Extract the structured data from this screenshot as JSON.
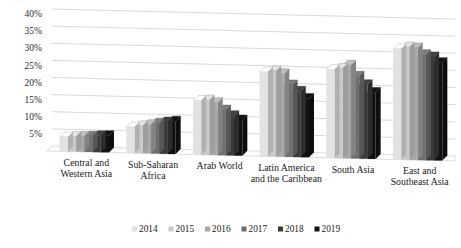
{
  "chart_data": {
    "type": "bar",
    "title": "",
    "subtitle": "",
    "xlabel": "",
    "ylabel": "",
    "ylim": [
      0,
      40
    ],
    "ytick_labels": [
      "5%",
      "10%",
      "15%",
      "20%",
      "25%",
      "30%",
      "35%",
      "40%"
    ],
    "ytick_values": [
      5,
      10,
      15,
      20,
      25,
      30,
      35,
      40
    ],
    "grid": true,
    "legend_position": "bottom",
    "style": "3d-clustered-column",
    "categories": [
      "Central and Western Asia",
      "Sub-Saharan Africa",
      "Arab World",
      "Latin America and the Caribbean",
      "South Asia",
      "East and Southeast Asia"
    ],
    "category_lines": [
      [
        "Central and",
        "Western Asia"
      ],
      [
        "Sub-Saharan",
        "Africa"
      ],
      [
        "Arab World"
      ],
      [
        "Latin America",
        "and the Caribbean"
      ],
      [
        "South Asia"
      ],
      [
        "East and",
        "Southeast Asia"
      ]
    ],
    "series": [
      {
        "name": "2014",
        "color": "#e2e2e2",
        "values": [
          4.2,
          7.6,
          15.8,
          24.6,
          25.8,
          32.3
        ]
      },
      {
        "name": "2015",
        "color": "#c9c9c9",
        "values": [
          4.4,
          8.0,
          16.0,
          25.0,
          26.2,
          32.9
        ]
      },
      {
        "name": "2016",
        "color": "#a8a8a8",
        "values": [
          4.5,
          8.4,
          15.3,
          24.2,
          27.2,
          32.7
        ]
      },
      {
        "name": "2017",
        "color": "#6e6e6e",
        "values": [
          4.6,
          8.9,
          13.2,
          21.0,
          24.0,
          30.8
        ]
      },
      {
        "name": "2018",
        "color": "#3a3a3a",
        "values": [
          4.8,
          9.3,
          11.6,
          19.2,
          21.6,
          30.2
        ]
      },
      {
        "name": "2019",
        "color": "#111111",
        "values": [
          4.9,
          9.6,
          10.4,
          17.2,
          19.4,
          28.6
        ]
      }
    ]
  },
  "legend": {
    "items": [
      {
        "label": "2014",
        "color": "#e2e2e2"
      },
      {
        "label": "2015",
        "color": "#c9c9c9"
      },
      {
        "label": "2016",
        "color": "#a8a8a8"
      },
      {
        "label": "2017",
        "color": "#6e6e6e"
      },
      {
        "label": "2018",
        "color": "#3a3a3a"
      },
      {
        "label": "2019",
        "color": "#111111"
      }
    ]
  },
  "colors": {
    "background": "#ffffff",
    "gridline": "#c9c9c9",
    "text": "#1a1a1a",
    "floor": "#fdfdfd"
  }
}
